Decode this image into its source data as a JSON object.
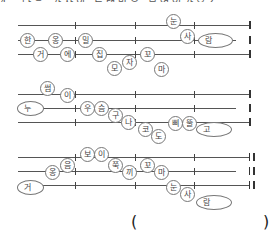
{
  "title_cut": "4. 다음 가사의 노랫말은 무엇인가요?",
  "groups": [
    {
      "lines_y": [
        25,
        40,
        54
      ],
      "syllables": [
        {
          "t": "눈",
          "x": 166,
          "y": 14
        },
        {
          "t": "한",
          "x": 20,
          "y": 33
        },
        {
          "t": "옹",
          "x": 48,
          "y": 33
        },
        {
          "t": "밀",
          "x": 78,
          "y": 33
        },
        {
          "t": "사",
          "x": 180,
          "y": 29
        },
        {
          "t": "거",
          "x": 33,
          "y": 47
        },
        {
          "t": "에",
          "x": 60,
          "y": 47
        },
        {
          "t": "집",
          "x": 92,
          "y": 47
        },
        {
          "t": "모",
          "x": 107,
          "y": 61
        },
        {
          "t": "자",
          "x": 122,
          "y": 55
        },
        {
          "t": "꼬",
          "x": 140,
          "y": 47
        },
        {
          "t": "마",
          "x": 154,
          "y": 62
        }
      ],
      "ovals": [
        {
          "t": "람",
          "x": 198,
          "y": 33,
          "w": 33
        }
      ]
    },
    {
      "lines_y": [
        94,
        108,
        122
      ],
      "syllables": [
        {
          "t": "썸",
          "x": 40,
          "y": 81
        },
        {
          "t": "이",
          "x": 60,
          "y": 88
        },
        {
          "t": "우",
          "x": 80,
          "y": 101
        },
        {
          "t": "슴",
          "x": 94,
          "y": 101
        },
        {
          "t": "구",
          "x": 108,
          "y": 108
        },
        {
          "t": "나",
          "x": 121,
          "y": 115
        },
        {
          "t": "코",
          "x": 138,
          "y": 122
        },
        {
          "t": "도",
          "x": 151,
          "y": 129
        },
        {
          "t": "삐",
          "x": 168,
          "y": 116
        },
        {
          "t": "뚤",
          "x": 182,
          "y": 116
        }
      ],
      "ovals": [
        {
          "t": "누",
          "x": 17,
          "y": 101,
          "w": 25
        },
        {
          "t": "고",
          "x": 196,
          "y": 122,
          "w": 34
        }
      ]
    },
    {
      "lines_y": [
        157,
        171,
        185
      ],
      "syllables": [
        {
          "t": "보",
          "x": 80,
          "y": 147
        },
        {
          "t": "이",
          "x": 94,
          "y": 147
        },
        {
          "t": "옹",
          "x": 45,
          "y": 165
        },
        {
          "t": "음",
          "x": 60,
          "y": 158
        },
        {
          "t": "쭉",
          "x": 108,
          "y": 158
        },
        {
          "t": "끼",
          "x": 122,
          "y": 165
        },
        {
          "t": "꼬",
          "x": 140,
          "y": 158
        },
        {
          "t": "마",
          "x": 154,
          "y": 165
        },
        {
          "t": "눈",
          "x": 166,
          "y": 180
        },
        {
          "t": "사",
          "x": 180,
          "y": 187
        }
      ],
      "ovals": [
        {
          "t": "거",
          "x": 17,
          "y": 180,
          "w": 25
        },
        {
          "t": "람",
          "x": 196,
          "y": 195,
          "w": 34
        }
      ]
    }
  ],
  "answer": {
    "open": "(",
    "close": ")"
  }
}
